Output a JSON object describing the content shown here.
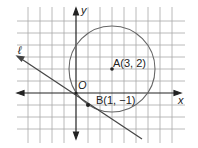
{
  "diagram": {
    "type": "coordinate-plane",
    "axes": {
      "x_label": "x",
      "y_label": "y",
      "origin_label": "O"
    },
    "grid_unit_px": 12,
    "origin_px": [
      76,
      93
    ],
    "line": {
      "name": "ℓ",
      "passes_through": [
        "O(0, 0)",
        "B(1, -1)"
      ],
      "label": "ℓ"
    },
    "circle": {
      "center_label": "A(3, 2)",
      "center": [
        3,
        2
      ],
      "passes_through": [
        1,
        -1
      ]
    },
    "points": [
      {
        "label": "A(3, 2)",
        "x": 3,
        "y": 2
      },
      {
        "label": "B(1, −1)",
        "x": 1,
        "y": -1
      }
    ],
    "colors": {
      "grid": "#a0a0a0",
      "axes": "#222222",
      "circle": "#666666",
      "line": "#444444"
    }
  }
}
